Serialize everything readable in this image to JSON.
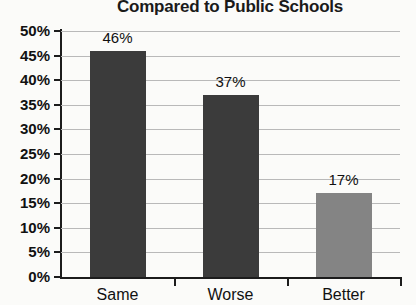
{
  "chart_data": {
    "type": "bar",
    "title": "Compared to Public Schools",
    "xlabel": "",
    "ylabel": "",
    "categories": [
      "Same",
      "Worse",
      "Better"
    ],
    "values": [
      46,
      37,
      17
    ],
    "value_labels": [
      "46%",
      "37%",
      "17%"
    ],
    "bar_colors": [
      "#3b3b3b",
      "#3b3b3b",
      "#848484"
    ],
    "ylim": [
      0,
      50
    ],
    "y_tick_labels": [
      "50%",
      "45%",
      "40%",
      "35%",
      "30%",
      "25%",
      "20%",
      "15%",
      "10%",
      "5%",
      "0%"
    ],
    "y_tick_values": [
      50,
      45,
      40,
      35,
      30,
      25,
      20,
      15,
      10,
      5,
      0
    ],
    "grid": true,
    "legend": false,
    "units": "percent"
  },
  "colors": {
    "bar_dark": "#3b3b3b",
    "bar_light": "#848484",
    "gridline": "#b9b9b9",
    "axis": "#1c1c1c",
    "text": "#111111",
    "background": "#fbfbf9"
  }
}
